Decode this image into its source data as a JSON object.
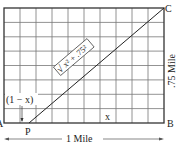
{
  "diagram": {
    "type": "geometry-grid",
    "grid": {
      "columns": 10,
      "rows": 8
    },
    "points": [
      {
        "id": "A",
        "label": "A"
      },
      {
        "id": "P",
        "label": "P"
      },
      {
        "id": "B",
        "label": "B"
      },
      {
        "id": "C",
        "label": "C"
      }
    ],
    "segments": [
      {
        "from": "P",
        "to": "C",
        "label": "√x² + .75²"
      }
    ],
    "labels": {
      "A": "A",
      "P": "P",
      "B": "B",
      "C": "C",
      "one_minus_x": "(1 − x)",
      "x": "x",
      "hypotenuse_sqrt": "√",
      "hypotenuse_expr": "x² + .75²",
      "width": "1 Mile",
      "height": ".75 Mile"
    }
  }
}
